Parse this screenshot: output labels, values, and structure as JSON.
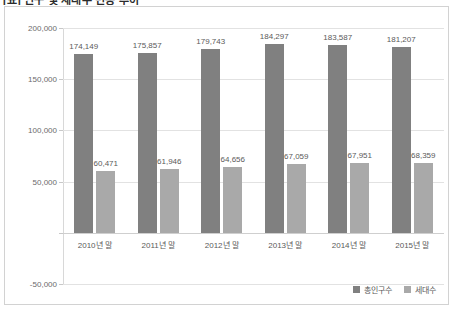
{
  "title": "[표] 인구 및 세대수 변동 추이",
  "chart_data": {
    "type": "bar",
    "title": "",
    "xlabel": "",
    "ylabel": "",
    "categories": [
      "2010년 말",
      "2011년 말",
      "2012년 말",
      "2013년 말",
      "2014년 말",
      "2015년 말"
    ],
    "series": [
      {
        "name": "총인구수",
        "color": "#808080",
        "values": [
          174149,
          175857,
          179743,
          184297,
          183587,
          181207
        ],
        "labels": [
          "174,149",
          "175,857",
          "179,743",
          "184,297",
          "183,587",
          "181,207"
        ]
      },
      {
        "name": "세대수",
        "color": "#a9a9a9",
        "values": [
          60471,
          61946,
          64656,
          67059,
          67951,
          68359
        ],
        "labels": [
          "60,471",
          "61,946",
          "64,656",
          "67,059",
          "67,951",
          "68,359"
        ]
      }
    ],
    "ylim": [
      -50000,
      200000
    ],
    "yticks": [
      200000,
      150000,
      100000,
      50000,
      0,
      -50000
    ],
    "ytick_labels": [
      "200,000",
      "150,000",
      "100,000",
      "50,000",
      "",
      "-50,000"
    ],
    "grid": true,
    "legend_position": "bottom-right"
  }
}
